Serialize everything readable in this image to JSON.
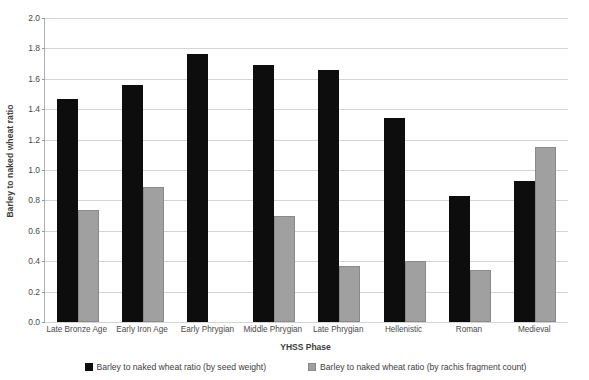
{
  "chart_data": {
    "type": "bar",
    "title": "",
    "xlabel": "YHSS Phase",
    "ylabel": "Barley to naked wheat ratio",
    "ylim": [
      0.0,
      2.0
    ],
    "ytick_step": 0.2,
    "grid": true,
    "legend_position": "bottom",
    "categories": [
      "Late Bronze Age",
      "Early Iron Age",
      "Early Phrygian",
      "Middle Phrygian",
      "Late Phrygian",
      "Hellenistic",
      "Roman",
      "Medieval"
    ],
    "ytick_labels": [
      "0.0",
      "0.2",
      "0.4",
      "0.6",
      "0.8",
      "1.0",
      "1.2",
      "1.4",
      "1.6",
      "1.8",
      "2.0"
    ],
    "series": [
      {
        "name": "Barley to naked wheat ratio (by seed weight)",
        "color": "#0d0d0d",
        "values": [
          1.47,
          1.56,
          1.76,
          1.69,
          1.66,
          1.34,
          0.83,
          0.93
        ]
      },
      {
        "name": "Barley to naked wheat ratio (by rachis fragment count)",
        "color": "#a0a0a0",
        "values": [
          0.74,
          0.89,
          null,
          0.7,
          0.37,
          0.4,
          0.34,
          1.15
        ]
      }
    ]
  }
}
